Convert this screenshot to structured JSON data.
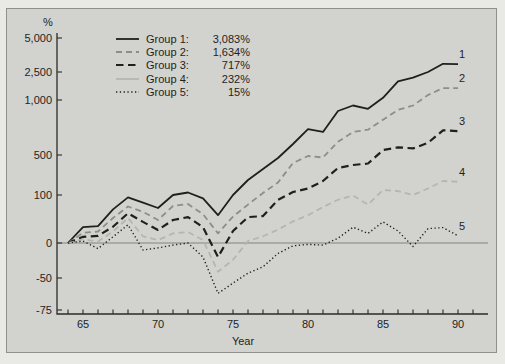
{
  "chart_data": {
    "type": "line",
    "title": "",
    "y_unit": "%",
    "xlabel": "Year",
    "ylim": [
      -75,
      5000
    ],
    "grid": false,
    "legend_position": "top-left-inside",
    "x": [
      64,
      65,
      66,
      67,
      68,
      69,
      70,
      71,
      72,
      73,
      74,
      75,
      76,
      77,
      78,
      79,
      80,
      81,
      82,
      83,
      84,
      85,
      86,
      87,
      88,
      89,
      90
    ],
    "x_ticks": [
      {
        "value": 65,
        "label": "65"
      },
      {
        "value": 70,
        "label": "70"
      },
      {
        "value": 75,
        "label": "75"
      },
      {
        "value": 80,
        "label": "80"
      },
      {
        "value": 85,
        "label": "85"
      },
      {
        "value": 90,
        "label": "90"
      }
    ],
    "y_ticks": [
      {
        "value": 5000,
        "label": "5,000"
      },
      {
        "value": 2500,
        "label": "2,500"
      },
      {
        "value": 1000,
        "label": "1,000"
      },
      {
        "value": 500,
        "label": "500"
      },
      {
        "value": 100,
        "label": "100"
      },
      {
        "value": 0,
        "label": "0"
      },
      {
        "value": -50,
        "label": "-50"
      },
      {
        "value": -75,
        "label": "-75"
      }
    ],
    "series": [
      {
        "name": "Group 1",
        "legend_label": "Group 1:",
        "legend_value": "3,083%",
        "end_label": "1",
        "line_style": "solid",
        "legend_style": "solid",
        "color": "#1f1f1e",
        "values": [
          0,
          33,
          35,
          70,
          95,
          84,
          73,
          100,
          125,
          93,
          58,
          100,
          250,
          360,
          470,
          600,
          735,
          710,
          900,
          950,
          920,
          1120,
          2000,
          2200,
          2500,
          3100,
          3083
        ]
      },
      {
        "name": "Group 2",
        "legend_label": "Group 2:",
        "legend_value": "1,634%",
        "end_label": "2",
        "line_style": "dashed",
        "legend_style": "dashed",
        "color": "#8d8d8a",
        "values": [
          0,
          21,
          24,
          52,
          76,
          65,
          48,
          77,
          81,
          60,
          20,
          55,
          80,
          120,
          225,
          420,
          490,
          475,
          620,
          710,
          730,
          820,
          910,
          950,
          1270,
          1640,
          1634
        ]
      },
      {
        "name": "Group 3",
        "legend_label": "Group 3:",
        "legend_value": "717%",
        "end_label": "3",
        "line_style": "dashed-bold",
        "legend_style": "dashed-bold",
        "color": "#1f1f1e",
        "values": [
          0,
          13,
          15,
          34,
          62,
          44,
          27,
          48,
          54,
          33,
          -20,
          25,
          54,
          56,
          90,
          130,
          165,
          240,
          370,
          400,
          415,
          545,
          570,
          560,
          610,
          725,
          717
        ]
      },
      {
        "name": "Group 4",
        "legend_label": "Group 4:",
        "legend_value": "232%",
        "end_label": "4",
        "line_style": "dashed",
        "legend_style": "solid",
        "color": "#b5b5b1",
        "values": [
          0,
          8,
          3,
          24,
          52,
          14,
          6,
          20,
          23,
          6,
          -41,
          -24,
          4,
          14,
          28,
          45,
          58,
          75,
          90,
          99,
          80,
          150,
          140,
          100,
          165,
          240,
          232
        ]
      },
      {
        "name": "Group 5",
        "legend_label": "Group 5:",
        "legend_value": "15%",
        "end_label": "5",
        "line_style": "dotted",
        "legend_style": "dotted",
        "color": "#1f1f1e",
        "values": [
          0,
          4,
          -8,
          13,
          38,
          -10,
          -7,
          -3,
          0,
          -20,
          -62,
          -54,
          -43,
          -34,
          -15,
          -4,
          -2,
          -3,
          10,
          33,
          20,
          44,
          25,
          -5,
          30,
          32,
          15
        ]
      }
    ]
  }
}
